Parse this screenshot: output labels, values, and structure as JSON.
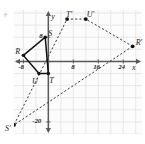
{
  "figure": {
    "kind": "coordinate-plane-dilation",
    "corner_mark": "+",
    "axis_labels": {
      "x": "x",
      "y": "y"
    },
    "colors": {
      "grid": "#e2e2e2",
      "axis": "#5a5a5a",
      "preimage": "#101010",
      "image": "#3c3c3c",
      "text": "#1d1d1d",
      "background": "#ffffff"
    },
    "x_ticks": [
      {
        "label": "-8",
        "value": -8
      },
      {
        "label": "8",
        "value": 8
      },
      {
        "label": "16",
        "value": 16
      },
      {
        "label": "24",
        "value": 24
      }
    ],
    "y_ticks": [
      {
        "label": "8",
        "value": 8
      },
      {
        "label": "-20",
        "value": -20
      }
    ],
    "preimage": {
      "name": "RSTU",
      "style": "solid",
      "vertices": [
        {
          "label": "R",
          "x": -8,
          "y": 2
        },
        {
          "label": "S",
          "x": -1,
          "y": 8
        },
        {
          "label": "T",
          "x": 0,
          "y": -4
        },
        {
          "label": "U",
          "x": -3,
          "y": -4
        }
      ]
    },
    "image": {
      "name": "R'S'T'U'",
      "style": "dashed",
      "vertices": [
        {
          "label": "R'",
          "x": 27,
          "y": 5
        },
        {
          "label": "S'",
          "x": -11,
          "y": -21
        },
        {
          "label": "T'",
          "x": 6,
          "y": 14
        },
        {
          "label": "U'",
          "x": 12,
          "y": 14
        }
      ]
    }
  },
  "chart_data": {
    "type": "scatter",
    "title": "",
    "xlabel": "x",
    "ylabel": "y",
    "xlim": [
      -11,
      30
    ],
    "ylim": [
      -24,
      17
    ],
    "grid": true,
    "legend": "none",
    "series": [
      {
        "name": "RSTU (preimage)",
        "style": "solid",
        "closed": true,
        "points": [
          {
            "label": "R",
            "x": -8,
            "y": 2
          },
          {
            "label": "S",
            "x": -1,
            "y": 8
          },
          {
            "label": "T",
            "x": 0,
            "y": -4
          },
          {
            "label": "U",
            "x": -3,
            "y": -4
          }
        ]
      },
      {
        "name": "R'S'T'U' (image)",
        "style": "dashed",
        "closed": true,
        "points": [
          {
            "label": "R'",
            "x": 27,
            "y": 5
          },
          {
            "label": "S'",
            "x": -11,
            "y": -21
          },
          {
            "label": "T'",
            "x": 6,
            "y": 14
          },
          {
            "label": "U'",
            "x": 12,
            "y": 14
          }
        ]
      }
    ]
  }
}
